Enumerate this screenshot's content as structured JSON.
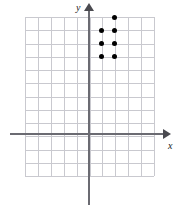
{
  "chart_data": {
    "type": "scatter",
    "title": "",
    "xlabel": "x",
    "ylabel": "y",
    "grid": true,
    "legend": null,
    "xlim": [
      -5,
      5
    ],
    "ylim": [
      -3,
      9
    ],
    "x_tick_labels": [],
    "y_tick_labels": [],
    "points": [
      {
        "x": 2,
        "y": 9
      },
      {
        "x": 1,
        "y": 8
      },
      {
        "x": 2,
        "y": 8
      },
      {
        "x": 1,
        "y": 7
      },
      {
        "x": 2,
        "y": 7
      },
      {
        "x": 1,
        "y": 6
      },
      {
        "x": 2,
        "y": 6
      }
    ],
    "point_count": 7,
    "colors": {
      "point": "#000000",
      "axis": "#6b6b72",
      "grid": "#c9c9cf",
      "background": "#ffffff"
    }
  },
  "axes": {
    "x_label": "x",
    "y_label": "y"
  },
  "geometry": {
    "grid_left": 25,
    "grid_top": 17,
    "grid_right": 154,
    "grid_bottom": 176,
    "cell": 12.9,
    "origin_x": 89,
    "origin_y": 134,
    "cols": 10,
    "rows": 12
  }
}
